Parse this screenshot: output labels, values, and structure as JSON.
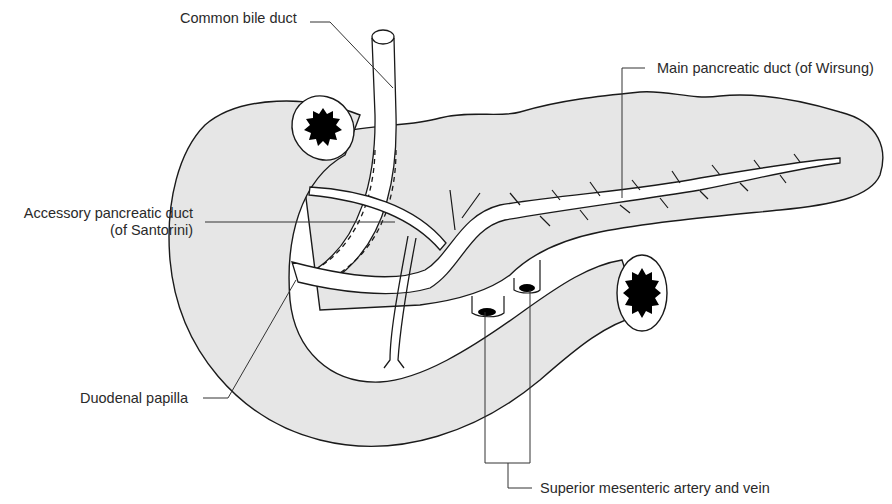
{
  "labels": {
    "common_bile_duct": "Common bile duct",
    "main_duct": "Main pancreatic duct (of Wirsung)",
    "accessory_duct_line1": "Accessory pancreatic duct",
    "accessory_duct_line2": "(of Santorini)",
    "duodenal_papilla": "Duodenal papilla",
    "sma_smv": "Superior mesenteric artery and vein"
  },
  "colors": {
    "tissue_fill": "#e6e6e6",
    "outline": "#1a1a1a",
    "duct_fill": "#ffffff",
    "lumen": "#000000"
  }
}
